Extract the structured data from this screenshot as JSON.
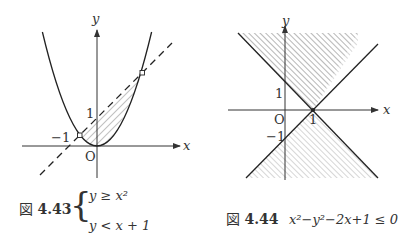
{
  "figure_left": {
    "axis_x_label": "x",
    "axis_y_label": "y",
    "origin_label": "O",
    "tick_y_1": "1",
    "tick_x_neg1": "−1",
    "curves": [
      "y = x^2 (solid parabola)",
      "y = x + 1 (dashed line)"
    ],
    "caption": {
      "fig_prefix": "図",
      "fig_number": "4.43",
      "line1": "y ≥ x²",
      "line2": "y < x + 1"
    }
  },
  "figure_right": {
    "axis_x_label": "x",
    "axis_y_label": "y",
    "origin_label": "O",
    "tick_y_1": "1",
    "tick_y_neg1": "−1",
    "tick_x_1": "1",
    "curves": [
      "y = x − 1",
      "y = −x + 1"
    ],
    "caption": {
      "fig_prefix": "図",
      "fig_number": "4.44",
      "text": "x²−y²−2x+1 ≤ 0"
    }
  },
  "colors": {
    "ink": "#333333",
    "hatch": "#777777"
  }
}
